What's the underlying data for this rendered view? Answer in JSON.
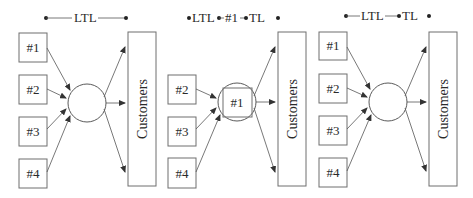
{
  "colors": {
    "stroke": "#6e6e6e",
    "text": "#2a2a2a",
    "background": "#ffffff"
  },
  "panels": [
    {
      "id": "panel-1",
      "legend": {
        "segments": [
          "LTL"
        ],
        "display": "•——LTL——•"
      },
      "suppliers": [
        "#1",
        "#2",
        "#3",
        "#4"
      ],
      "hub_label": "",
      "customers_label": "Customers"
    },
    {
      "id": "panel-2",
      "legend": {
        "segments": [
          "LTL",
          "#1",
          "TL"
        ],
        "display": "•LTL•-#1-•TL•"
      },
      "suppliers": [
        "#2",
        "#3",
        "#4"
      ],
      "hub_label": "#1",
      "customers_label": "Customers"
    },
    {
      "id": "panel-3",
      "legend": {
        "segments": [
          "LTL",
          "TL"
        ],
        "display": "•—LTL—•TL•"
      },
      "suppliers": [
        "#1",
        "#2",
        "#3",
        "#4"
      ],
      "hub_label": "",
      "customers_label": "Customers"
    }
  ]
}
